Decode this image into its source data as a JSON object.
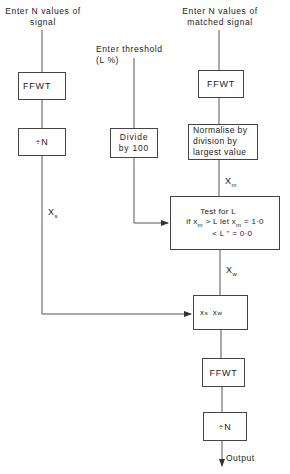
{
  "diagram": {
    "inputs": {
      "signal": "Enter N values of\nsignal",
      "signal_line1": "Enter N values of",
      "signal_line2": "signal",
      "threshold_line1": "Enter threshold",
      "threshold_line2": "(L %)",
      "matched_line1": "Enter N values of",
      "matched_line2": "matched signal"
    },
    "blocks": {
      "ffwt_signal": "FFWT",
      "div_n_signal": "÷N",
      "divide_100_line1": "Divide",
      "divide_100_line2": "by 100",
      "ffwt_matched": "FFWT",
      "normalise_line1": "Normalise by",
      "normalise_line2": "division by",
      "normalise_line3": "largest value",
      "test_title": "Test for L",
      "test_row1_prefix": "if x",
      "test_row1_sub": "m",
      "test_row1_mid": " > L  let x",
      "test_row1_sub2": "m",
      "test_row1_val": " = 1·0",
      "test_row2": "< L  \"       = 0·0",
      "multiply_a": "x",
      "multiply_a_sub": "s",
      "multiply_b": "x",
      "multiply_b_sub": "w",
      "ffwt_output": "FFWT",
      "div_n_output": "÷N"
    },
    "labels": {
      "xs": "X",
      "xs_sub": "s",
      "xm": "X",
      "xm_sub": "m",
      "xw": "X",
      "xw_sub": "w",
      "output": "Output"
    },
    "colors": {
      "line": "#444444",
      "text": "#222222",
      "background": "#ffffff"
    }
  }
}
